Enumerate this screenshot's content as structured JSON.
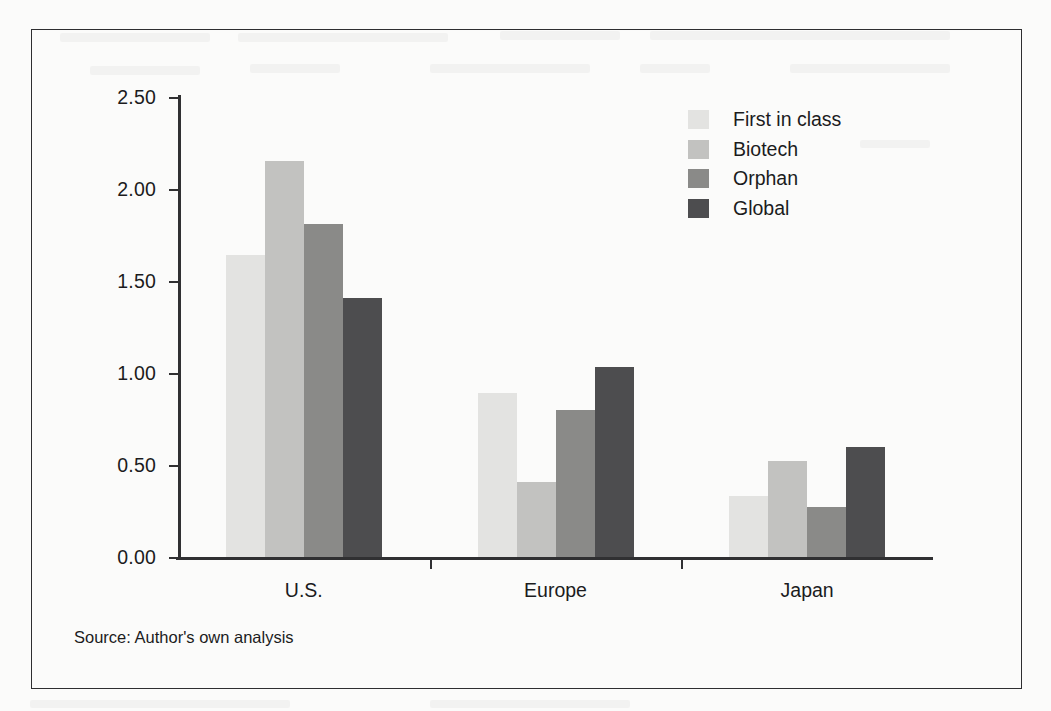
{
  "figure": {
    "source_caption": "Source: Author's own analysis",
    "frame_color": "#2e2e30",
    "background_color": "#fbfbfa"
  },
  "chart_data": {
    "type": "bar",
    "title": "",
    "subtitle": "",
    "xlabel": "",
    "ylabel": "",
    "categories": [
      "U.S.",
      "Europe",
      "Japan"
    ],
    "series": [
      {
        "name": "First in class",
        "color": "#e3e3e1",
        "values": [
          1.64,
          0.89,
          0.33
        ]
      },
      {
        "name": "Biotech",
        "color": "#c2c2c0",
        "values": [
          2.15,
          0.41,
          0.52
        ]
      },
      {
        "name": "Orphan",
        "color": "#8a8a88",
        "values": [
          1.81,
          0.8,
          0.27
        ]
      },
      {
        "name": "Global",
        "color": "#4d4d4f",
        "values": [
          1.41,
          1.03,
          0.6
        ]
      }
    ],
    "ylim": [
      0,
      2.5
    ],
    "ytick_values": [
      0,
      0.5,
      1.0,
      1.5,
      2.0,
      2.5
    ],
    "ytick_labels": [
      "0.00",
      "0.50",
      "1.00",
      "1.50",
      "2.00",
      "2.50"
    ],
    "grid": false,
    "legend_position": "upper right"
  }
}
